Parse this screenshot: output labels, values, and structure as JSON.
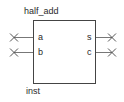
{
  "block": {
    "title": "half_add",
    "instance": "inst",
    "inputs": [
      {
        "name": "a"
      },
      {
        "name": "b"
      }
    ],
    "outputs": [
      {
        "name": "s"
      },
      {
        "name": "c"
      }
    ],
    "colors": {
      "box": "#444444",
      "wire": "#777777",
      "marker": "#555555",
      "text": "#2a2a2a"
    }
  }
}
